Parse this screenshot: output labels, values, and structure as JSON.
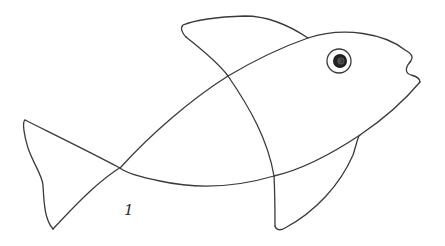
{
  "figure": {
    "label": "1",
    "stroke_color": "#3a3a3a",
    "parts": [
      {
        "name": "body-outline",
        "description": "lens-shaped body from tail crossing to nose"
      },
      {
        "name": "tail-fin",
        "description": "triangular tail on the left"
      },
      {
        "name": "dorsal-fin",
        "description": "curved fin on top"
      },
      {
        "name": "pelvic-fin",
        "description": "curved fin on the bottom"
      },
      {
        "name": "division-curve",
        "description": "curve from dorsal fin down to pelvic fin crossing the body"
      },
      {
        "name": "eye",
        "description": "circle with dark shaded pupil"
      },
      {
        "name": "mouth",
        "description": "open mouth notch at the nose"
      }
    ]
  }
}
